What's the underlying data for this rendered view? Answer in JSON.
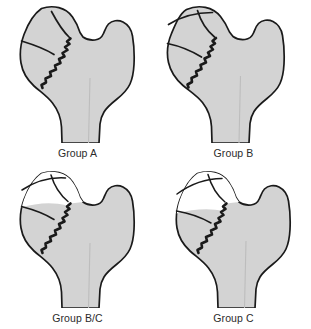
{
  "figure": {
    "background_color": "#ffffff",
    "bone_fill_color": "#d3d3d3",
    "bone_outline_color": "#1a1a1a",
    "necrotic_fill_color": "#ffffff",
    "label_color": "#2b2b2b",
    "shaft_line_color": "#b5b5b5"
  },
  "panels": [
    {
      "id": "group-a",
      "label": "Group A",
      "position": "top-left",
      "head_shading": "fully shaded",
      "fracture_lines": 2,
      "notes": "Femoral head fully shaded; two straight segment lines across head; jagged subcapital fracture line at head-neck junction."
    },
    {
      "id": "group-b",
      "label": "Group B",
      "position": "top-right",
      "head_shading": "fully shaded",
      "fracture_lines": 3,
      "notes": "Femoral head fully shaded with three segment lines; jagged fracture line at head-neck junction; faint vertical line in femoral shaft."
    },
    {
      "id": "group-bc",
      "label": "Group B/C",
      "position": "bottom-left",
      "head_shading": "partially unshaded",
      "fracture_lines": 3,
      "notes": "Upper portion of femoral head unshaded (white) indicating avascular segment; three segment lines; jagged fracture line at head-neck junction."
    },
    {
      "id": "group-c",
      "label": "Group C",
      "position": "bottom-right",
      "head_shading": "largely unshaded",
      "fracture_lines": 3,
      "notes": "Large unshaded (white) region of femoral head indicating extensive avascular segment; jagged fracture line at head-neck junction; faint vertical line in femoral shaft."
    }
  ]
}
